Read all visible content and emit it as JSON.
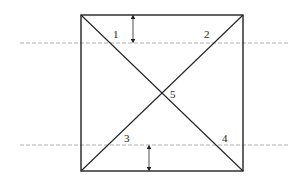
{
  "diagram": {
    "square": {
      "x1": 81,
      "y1": 15,
      "x2": 243,
      "y2": 171,
      "stroke": "#222222"
    },
    "dashed_lines": [
      {
        "y": 43,
        "x_start": 20,
        "x_end": 290
      },
      {
        "y": 145,
        "x_start": 20,
        "x_end": 290
      }
    ],
    "arrows": [
      {
        "x": 133,
        "y_top": 15,
        "y_bottom": 43
      },
      {
        "x": 149,
        "y_top": 145,
        "y_bottom": 171
      }
    ],
    "labels": [
      {
        "text": "1",
        "x": 113,
        "y": 38
      },
      {
        "text": "2",
        "x": 204,
        "y": 38
      },
      {
        "text": "3",
        "x": 124,
        "y": 142
      },
      {
        "text": "4",
        "x": 222,
        "y": 142
      },
      {
        "text": "5",
        "x": 170,
        "y": 98
      }
    ],
    "dash_color": "#999999",
    "line_color": "#222222"
  }
}
